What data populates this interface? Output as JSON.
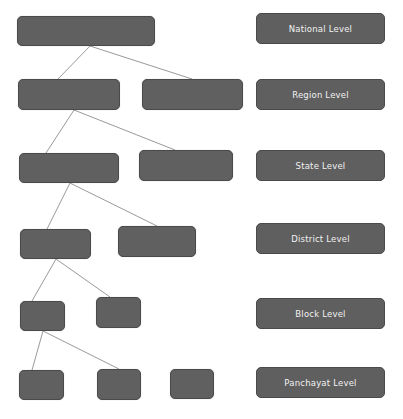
{
  "diagram": {
    "type": "hierarchy",
    "levels": [
      {
        "label": "National Level",
        "nodes": 1
      },
      {
        "label": "Region Level",
        "nodes": 2
      },
      {
        "label": "State Level",
        "nodes": 2
      },
      {
        "label": "District Level",
        "nodes": 2
      },
      {
        "label": "Block Level",
        "nodes": 2
      },
      {
        "label": "Panchayat Level",
        "nodes": 3
      }
    ],
    "colors": {
      "box": "#606060",
      "border": "#4a4a4a",
      "line": "#999999",
      "text": "#f2f2f2"
    }
  }
}
